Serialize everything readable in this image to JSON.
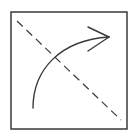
{
  "diagram": {
    "icon": "reflect-rotate-icon",
    "colors": {
      "background": "#ffffff",
      "stroke": "#3a3a3a"
    },
    "frame": {
      "x": 11,
      "y": 12,
      "width": 116,
      "height": 117
    },
    "dashed_line": {
      "x1": 17,
      "y1": 21,
      "x2": 121,
      "y2": 120
    },
    "curved_arrow": {
      "path": "M33,108 C33,70 60,40 109,37",
      "head_upper": "M88,27 L109,37",
      "head_lower": "M88,51 L109,37"
    }
  }
}
